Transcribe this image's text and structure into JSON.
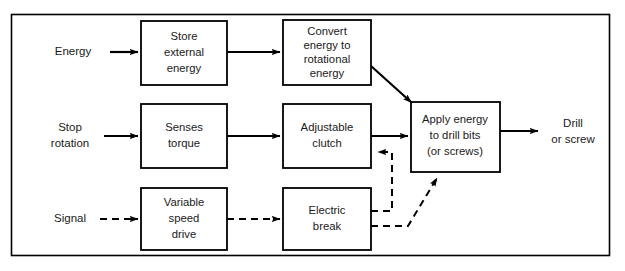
{
  "diagram": {
    "frame": {
      "x": 11,
      "y": 14,
      "width": 599,
      "height": 242
    },
    "colors": {
      "stroke": "#000000",
      "text": "#1a1a1a",
      "background": "#ffffff"
    },
    "boxes": [
      {
        "id": "store-external-energy",
        "lines": [
          "Store",
          "external",
          "energy"
        ],
        "x": 141,
        "y": 21,
        "width": 86,
        "height": 64
      },
      {
        "id": "convert-energy-to-rotational-energy",
        "lines": [
          "Convert",
          "energy to",
          "rotational",
          "energy"
        ],
        "x": 283,
        "y": 20,
        "width": 88,
        "height": 65
      },
      {
        "id": "senses-torque",
        "lines": [
          "Senses",
          "torque"
        ],
        "x": 141,
        "y": 104,
        "width": 86,
        "height": 64
      },
      {
        "id": "adjustable-clutch",
        "lines": [
          "Adjustable",
          "clutch"
        ],
        "x": 283,
        "y": 104,
        "width": 88,
        "height": 64
      },
      {
        "id": "apply-energy-to-drill-bits",
        "lines": [
          "Apply energy",
          "to drill bits",
          "(or screws)"
        ],
        "x": 411,
        "y": 102,
        "width": 89,
        "height": 70
      },
      {
        "id": "variable-speed-drive",
        "lines": [
          "Variable",
          "speed",
          "drive"
        ],
        "x": 141,
        "y": 188,
        "width": 86,
        "height": 62
      },
      {
        "id": "electric-break",
        "lines": [
          "Electric",
          "break"
        ],
        "x": 283,
        "y": 188,
        "width": 88,
        "height": 62
      }
    ],
    "io_labels": [
      {
        "id": "input-energy",
        "lines": [
          "Energy"
        ],
        "x": 73,
        "y": 52
      },
      {
        "id": "input-stop-rotation",
        "lines": [
          "Stop",
          "rotation"
        ],
        "x": 70,
        "y": 130
      },
      {
        "id": "input-signal",
        "lines": [
          "Signal"
        ],
        "x": 70,
        "y": 219
      },
      {
        "id": "output-drill-or-screw",
        "lines": [
          "Drill",
          "or screw"
        ],
        "x": 573,
        "y": 131
      }
    ],
    "connections": [
      {
        "id": "energy-to-store",
        "style": "solid",
        "from": "Energy",
        "to": "Store external energy"
      },
      {
        "id": "store-to-convert",
        "style": "solid",
        "from": "Store external energy",
        "to": "Convert energy to rotational energy"
      },
      {
        "id": "convert-to-apply",
        "style": "solid",
        "from": "Convert energy to rotational energy",
        "to": "Apply energy to drill bits (or screws)"
      },
      {
        "id": "stop-rotation-to-senses",
        "style": "solid",
        "from": "Stop rotation",
        "to": "Senses torque"
      },
      {
        "id": "senses-to-clutch",
        "style": "solid",
        "from": "Senses torque",
        "to": "Adjustable clutch"
      },
      {
        "id": "clutch-to-apply",
        "style": "solid",
        "from": "Adjustable clutch",
        "to": "Apply energy to drill bits (or screws)"
      },
      {
        "id": "apply-to-output",
        "style": "solid",
        "from": "Apply energy to drill bits (or screws)",
        "to": "Drill or screw"
      },
      {
        "id": "signal-to-variable-speed-drive",
        "style": "dashed",
        "from": "Signal",
        "to": "Variable speed drive"
      },
      {
        "id": "variable-speed-drive-to-electric-break",
        "style": "dashed",
        "from": "Variable speed drive",
        "to": "Electric break"
      },
      {
        "id": "electric-break-to-clutch-feedback",
        "style": "dashed",
        "from": "Electric break",
        "to": "Adjustable clutch"
      },
      {
        "id": "electric-break-to-apply-feedback",
        "style": "dashed",
        "from": "Electric break",
        "to": "Apply energy to drill bits (or screws)"
      }
    ]
  }
}
